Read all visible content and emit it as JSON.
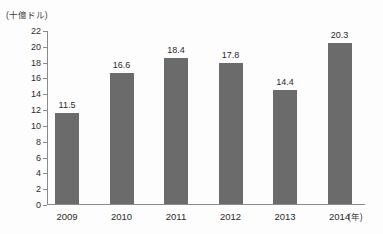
{
  "chart_data": {
    "type": "bar",
    "title": "",
    "subtitle": "",
    "unit_label": "(十億ドル)",
    "xlabel": "(年)",
    "ylabel": "",
    "categories": [
      "2009",
      "2010",
      "2011",
      "2012",
      "2013",
      "2014"
    ],
    "values": [
      11.5,
      16.6,
      18.4,
      17.8,
      14.4,
      20.3
    ],
    "value_labels": [
      "11.5",
      "16.6",
      "18.4",
      "17.8",
      "14.4",
      "20.3"
    ],
    "ylim": [
      0,
      22
    ],
    "ytick_step": 2,
    "ytick_labels": [
      "22",
      "20",
      "18",
      "16",
      "14",
      "12",
      "10",
      "8",
      "6",
      "4",
      "2",
      "0"
    ],
    "ytick_values": [
      22,
      20,
      18,
      16,
      14,
      12,
      10,
      8,
      6,
      4,
      2,
      0
    ],
    "grid": false,
    "legend": null,
    "legend_position": "none",
    "series": [
      {
        "name": "",
        "values": [
          11.5,
          16.6,
          18.4,
          17.8,
          14.4,
          20.3
        ],
        "color": "#6b6b6b"
      }
    ],
    "colors": {
      "bar": "#6b6b6b",
      "axis": "#8a8a8a",
      "text": "#2b2b2b",
      "background": "#fdfdfd"
    }
  }
}
